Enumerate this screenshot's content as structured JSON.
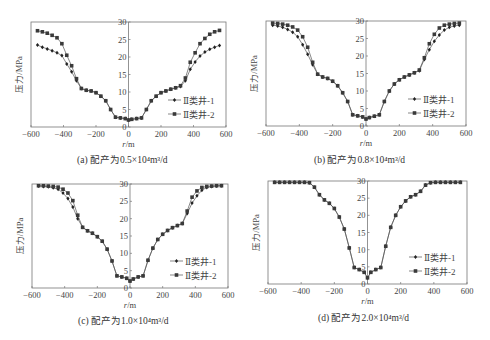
{
  "figure": {
    "panels": [
      {
        "id": "a",
        "caption": "(a) 配产为0.5×10⁴m³/d",
        "ylabel": "压力/MPa",
        "xlabel": "r/m",
        "legend": [
          "Ⅱ类井-1",
          "Ⅱ类井-2"
        ]
      },
      {
        "id": "b",
        "caption": "(b) 配产为0.8×10⁴m³/d",
        "ylabel": "压力/MPa",
        "xlabel": "r/m",
        "legend": [
          "Ⅱ类井-1",
          "Ⅱ类井-2"
        ]
      },
      {
        "id": "c",
        "caption": "(c) 配产为1.0×10⁴m³/d",
        "ylabel": "压力/MPa",
        "xlabel": "r/m",
        "legend": [
          "Ⅱ类井-1",
          "Ⅱ类井-2"
        ]
      },
      {
        "id": "d",
        "caption": "(d) 配产为2.0×10⁴m³/d",
        "ylabel": "压力/MPa",
        "xlabel": "r/m",
        "legend": [
          "Ⅱ类井-1",
          "Ⅱ类井-2"
        ]
      }
    ]
  },
  "chart_data": [
    {
      "type": "line",
      "title": "(a) 配产为0.5×10⁴m³/d",
      "xlabel": "r/m",
      "ylabel": "压力/MPa",
      "xlim": [
        -600,
        600
      ],
      "ylim": [
        0,
        30
      ],
      "xticks": [
        -600,
        -400,
        -200,
        0,
        200,
        400,
        600
      ],
      "yticks": [
        0,
        5,
        10,
        15,
        20,
        25,
        30
      ],
      "legend_position": "lower right",
      "series": [
        {
          "name": "Ⅱ类井-1",
          "marker": "diamond",
          "x": [
            -560,
            -530,
            -500,
            -470,
            -440,
            -410,
            -380,
            -350,
            -320,
            -290,
            -260,
            -230,
            -200,
            -170,
            -140,
            -110,
            -80,
            -50,
            -20,
            0,
            20,
            50,
            80,
            110,
            140,
            170,
            200,
            230,
            260,
            290,
            320,
            350,
            380,
            410,
            440,
            470,
            500,
            530,
            560
          ],
          "y": [
            23.4,
            22.8,
            22.3,
            21.8,
            21.2,
            20.4,
            18.0,
            15.8,
            13.2,
            11.0,
            10.5,
            10.3,
            9.8,
            8.8,
            7.5,
            5.0,
            2.8,
            2.6,
            2.4,
            2.0,
            2.2,
            2.4,
            2.6,
            5.0,
            7.5,
            8.8,
            9.8,
            10.3,
            10.8,
            11.2,
            11.6,
            13.2,
            16.5,
            18.6,
            20.3,
            21.4,
            22.2,
            22.8,
            23.3
          ]
        },
        {
          "name": "Ⅱ类井-2",
          "marker": "square",
          "x": [
            -560,
            -530,
            -500,
            -470,
            -440,
            -410,
            -380,
            -350,
            -320,
            -290,
            -260,
            -230,
            -200,
            -170,
            -140,
            -110,
            -80,
            -50,
            -20,
            0,
            20,
            50,
            80,
            110,
            140,
            170,
            200,
            230,
            260,
            290,
            320,
            350,
            380,
            410,
            440,
            470,
            500,
            530,
            560
          ],
          "y": [
            27.5,
            27.2,
            26.8,
            26.2,
            25.5,
            23.8,
            20.5,
            17.5,
            13.8,
            11.0,
            10.5,
            10.3,
            9.8,
            8.8,
            7.5,
            5.0,
            2.8,
            2.6,
            2.4,
            2.0,
            2.2,
            2.4,
            2.6,
            5.0,
            7.5,
            8.8,
            9.8,
            10.3,
            10.8,
            11.2,
            11.8,
            14.0,
            18.5,
            21.2,
            23.8,
            25.3,
            26.5,
            27.2,
            27.6
          ]
        }
      ]
    },
    {
      "type": "line",
      "title": "(b) 配产为0.8×10⁴m³/d",
      "xlabel": "r/m",
      "ylabel": "压力/MPa",
      "xlim": [
        -600,
        600
      ],
      "ylim": [
        0,
        30
      ],
      "xticks": [
        -600,
        -400,
        -200,
        0,
        200,
        400,
        600
      ],
      "yticks": [
        0,
        5,
        10,
        15,
        20,
        25,
        30
      ],
      "legend_position": "lower right",
      "series": [
        {
          "name": "Ⅱ类井-1",
          "marker": "diamond",
          "x": [
            -560,
            -530,
            -500,
            -470,
            -440,
            -410,
            -380,
            -350,
            -320,
            -290,
            -260,
            -230,
            -200,
            -170,
            -140,
            -110,
            -80,
            -50,
            -20,
            0,
            20,
            50,
            80,
            110,
            140,
            170,
            200,
            230,
            260,
            290,
            320,
            350,
            380,
            410,
            440,
            470,
            500,
            530,
            560
          ],
          "y": [
            28.8,
            28.6,
            28.2,
            27.6,
            26.8,
            25.5,
            23.2,
            20.5,
            17.5,
            14.8,
            14.0,
            13.6,
            12.8,
            11.5,
            9.5,
            7.0,
            3.2,
            2.9,
            2.6,
            2.0,
            2.4,
            2.8,
            3.2,
            7.0,
            10.0,
            12.0,
            13.2,
            14.0,
            14.6,
            15.2,
            15.8,
            19.0,
            21.8,
            24.2,
            26.0,
            27.4,
            28.2,
            28.6,
            28.8
          ]
        },
        {
          "name": "Ⅱ类井-2",
          "marker": "square",
          "x": [
            -560,
            -530,
            -500,
            -470,
            -440,
            -410,
            -380,
            -350,
            -320,
            -290,
            -260,
            -230,
            -200,
            -170,
            -140,
            -110,
            -80,
            -50,
            -20,
            0,
            20,
            50,
            80,
            110,
            140,
            170,
            200,
            230,
            260,
            290,
            320,
            350,
            380,
            410,
            440,
            470,
            500,
            530,
            560
          ],
          "y": [
            29.4,
            29.3,
            29.1,
            28.8,
            28.3,
            27.4,
            25.5,
            22.5,
            18.2,
            14.8,
            14.0,
            13.6,
            12.8,
            11.5,
            9.5,
            7.0,
            3.2,
            2.9,
            2.6,
            2.0,
            2.4,
            2.8,
            3.2,
            7.0,
            10.0,
            12.0,
            13.2,
            14.0,
            14.6,
            15.2,
            16.0,
            19.5,
            23.5,
            26.2,
            28.0,
            28.8,
            29.1,
            29.3,
            29.4
          ]
        }
      ]
    },
    {
      "type": "line",
      "title": "(c) 配产为1.0×10⁴m³/d",
      "xlabel": "r/m",
      "ylabel": "压力/MPa",
      "xlim": [
        -600,
        600
      ],
      "ylim": [
        0,
        30
      ],
      "xticks": [
        -600,
        -400,
        -200,
        0,
        200,
        400,
        600
      ],
      "yticks": [
        0,
        5,
        10,
        15,
        20,
        25,
        30
      ],
      "legend_position": "lower right",
      "series": [
        {
          "name": "Ⅱ类井-1",
          "marker": "diamond",
          "x": [
            -560,
            -530,
            -500,
            -470,
            -440,
            -410,
            -380,
            -350,
            -320,
            -290,
            -260,
            -230,
            -200,
            -170,
            -140,
            -110,
            -80,
            -50,
            -20,
            0,
            20,
            50,
            80,
            110,
            140,
            170,
            200,
            230,
            260,
            290,
            320,
            350,
            380,
            410,
            440,
            470,
            500,
            530,
            560
          ],
          "y": [
            29.4,
            29.3,
            29.2,
            28.9,
            28.5,
            27.4,
            25.8,
            23.4,
            20.0,
            17.5,
            16.5,
            15.8,
            14.8,
            13.5,
            11.2,
            7.8,
            3.5,
            3.2,
            2.8,
            2.0,
            2.6,
            3.2,
            3.5,
            8.0,
            11.5,
            14.0,
            15.5,
            16.6,
            17.4,
            18.0,
            18.6,
            21.5,
            24.5,
            26.6,
            28.2,
            29.0,
            29.3,
            29.4,
            29.5
          ]
        },
        {
          "name": "Ⅱ类井-2",
          "marker": "square",
          "x": [
            -560,
            -530,
            -500,
            -470,
            -440,
            -410,
            -380,
            -350,
            -320,
            -290,
            -260,
            -230,
            -200,
            -170,
            -140,
            -110,
            -80,
            -50,
            -20,
            0,
            20,
            50,
            80,
            110,
            140,
            170,
            200,
            230,
            260,
            290,
            320,
            350,
            380,
            410,
            440,
            470,
            500,
            530,
            560
          ],
          "y": [
            29.5,
            29.5,
            29.4,
            29.3,
            29.1,
            28.5,
            27.4,
            25.2,
            21.0,
            17.5,
            16.5,
            15.8,
            14.8,
            13.5,
            11.2,
            7.8,
            3.5,
            3.2,
            2.8,
            2.0,
            2.6,
            3.2,
            3.5,
            8.0,
            11.5,
            14.0,
            15.5,
            16.6,
            17.4,
            18.0,
            18.6,
            22.2,
            26.2,
            28.0,
            29.0,
            29.3,
            29.4,
            29.5,
            29.5
          ]
        }
      ]
    },
    {
      "type": "line",
      "title": "(d) 配产为2.0×10⁴m³/d",
      "xlabel": "r/m",
      "ylabel": "压力/MPa",
      "xlim": [
        -600,
        600
      ],
      "ylim": [
        0,
        30
      ],
      "xticks": [
        -600,
        -400,
        -200,
        0,
        200,
        400,
        600
      ],
      "yticks": [
        0,
        5,
        10,
        15,
        20,
        25,
        30
      ],
      "legend_position": "lower right",
      "series": [
        {
          "name": "Ⅱ类井-1",
          "marker": "diamond",
          "x": [
            -560,
            -530,
            -500,
            -470,
            -440,
            -410,
            -380,
            -350,
            -320,
            -290,
            -260,
            -230,
            -200,
            -170,
            -140,
            -110,
            -80,
            -50,
            -20,
            0,
            20,
            50,
            80,
            110,
            140,
            170,
            200,
            230,
            260,
            290,
            320,
            350,
            380,
            410,
            440,
            470,
            500,
            530,
            560
          ],
          "y": [
            29.6,
            29.6,
            29.6,
            29.6,
            29.6,
            29.6,
            29.6,
            29.5,
            28.2,
            26.0,
            24.5,
            23.5,
            22.0,
            19.5,
            16.0,
            10.5,
            4.8,
            4.2,
            3.4,
            1.8,
            3.4,
            4.2,
            4.8,
            11.0,
            16.5,
            20.0,
            22.5,
            24.2,
            25.4,
            26.0,
            27.0,
            28.8,
            29.5,
            29.6,
            29.6,
            29.6,
            29.6,
            29.6,
            29.6
          ]
        },
        {
          "name": "Ⅱ类井-2",
          "marker": "square",
          "x": [
            -560,
            -530,
            -500,
            -470,
            -440,
            -410,
            -380,
            -350,
            -320,
            -290,
            -260,
            -230,
            -200,
            -170,
            -140,
            -110,
            -80,
            -50,
            -20,
            0,
            20,
            50,
            80,
            110,
            140,
            170,
            200,
            230,
            260,
            290,
            320,
            350,
            380,
            410,
            440,
            470,
            500,
            530,
            560
          ],
          "y": [
            29.6,
            29.6,
            29.6,
            29.6,
            29.6,
            29.6,
            29.6,
            29.5,
            28.2,
            26.0,
            24.5,
            23.5,
            22.0,
            19.5,
            16.0,
            10.5,
            4.8,
            4.2,
            3.4,
            1.8,
            3.4,
            4.2,
            4.8,
            11.0,
            16.5,
            20.0,
            22.5,
            24.2,
            25.4,
            26.0,
            27.0,
            28.8,
            29.5,
            29.6,
            29.6,
            29.6,
            29.6,
            29.6,
            29.6
          ]
        }
      ]
    }
  ]
}
